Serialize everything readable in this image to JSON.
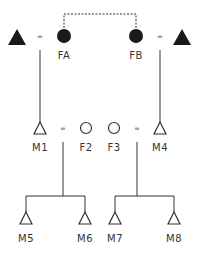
{
  "diagram": {
    "type": "pedigree",
    "colors": {
      "stroke": "#333333",
      "fill_filled": "#1a1a1a",
      "fill_empty": "#ffffff"
    },
    "generation_1": {
      "left_male": {
        "symbol": "filled-triangle",
        "label": ""
      },
      "FA": {
        "symbol": "filled-circle",
        "label": "FA"
      },
      "FB": {
        "symbol": "filled-circle",
        "label": "FB"
      },
      "right_male": {
        "symbol": "filled-triangle",
        "label": ""
      },
      "left_union": "=",
      "right_union": "=",
      "link": "dashed line connecting FA and FB"
    },
    "generation_2": {
      "M1": {
        "symbol": "open-triangle",
        "label": "M1"
      },
      "F2": {
        "symbol": "open-circle",
        "label": "F2"
      },
      "F3": {
        "symbol": "open-circle",
        "label": "F3"
      },
      "M4": {
        "symbol": "open-triangle",
        "label": "M4"
      },
      "left_union": "=",
      "right_union": "="
    },
    "generation_3": {
      "M5": {
        "symbol": "open-triangle",
        "label": "M5"
      },
      "M6": {
        "symbol": "open-triangle",
        "label": "M6"
      },
      "M7": {
        "symbol": "open-triangle",
        "label": "M7"
      },
      "M8": {
        "symbol": "open-triangle",
        "label": "M8"
      }
    }
  }
}
